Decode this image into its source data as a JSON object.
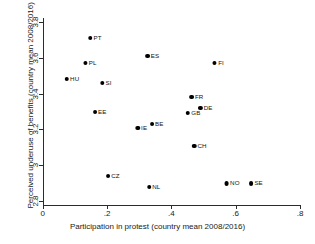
{
  "chart_data": {
    "type": "scatter",
    "title": "",
    "xlabel": "Participation in protest (country mean 2008/2016)",
    "ylabel": "Perceived underuse of benefits (country mean 2008/2016)",
    "xlim": [
      0,
      0.8
    ],
    "ylim": [
      2.78,
      3.82
    ],
    "xticks": [
      "0",
      ".2",
      ".4",
      ".6",
      ".8"
    ],
    "xtick_values": [
      0,
      0.2,
      0.4,
      0.6,
      0.8
    ],
    "yticks": [
      "2.8",
      "3",
      "3.2",
      "3.4",
      "3.6",
      "3.8"
    ],
    "ytick_values": [
      2.8,
      3.0,
      3.2,
      3.4,
      3.6,
      3.8
    ],
    "grid": false,
    "legend": null,
    "marker_color": "#000000",
    "points": [
      {
        "label": "PT",
        "x": 0.162,
        "y": 3.71
      },
      {
        "label": "ES",
        "x": 0.341,
        "y": 3.61
      },
      {
        "label": "PL",
        "x": 0.147,
        "y": 3.57
      },
      {
        "label": "FI",
        "x": 0.546,
        "y": 3.57
      },
      {
        "label": "HU",
        "x": 0.091,
        "y": 3.48
      },
      {
        "label": "SI",
        "x": 0.196,
        "y": 3.46
      },
      {
        "label": "FR",
        "x": 0.478,
        "y": 3.38
      },
      {
        "label": "DE",
        "x": 0.506,
        "y": 3.32
      },
      {
        "label": "EE",
        "x": 0.177,
        "y": 3.3
      },
      {
        "label": "GB",
        "x": 0.468,
        "y": 3.29
      },
      {
        "label": "BE",
        "x": 0.354,
        "y": 3.23
      },
      {
        "label": "IE",
        "x": 0.307,
        "y": 3.21
      },
      {
        "label": "CH",
        "x": 0.487,
        "y": 3.11
      },
      {
        "label": "CZ",
        "x": 0.218,
        "y": 2.94
      },
      {
        "label": "NO",
        "x": 0.589,
        "y": 2.9
      },
      {
        "label": "SE",
        "x": 0.663,
        "y": 2.9
      },
      {
        "label": "NL",
        "x": 0.345,
        "y": 2.88
      }
    ]
  }
}
